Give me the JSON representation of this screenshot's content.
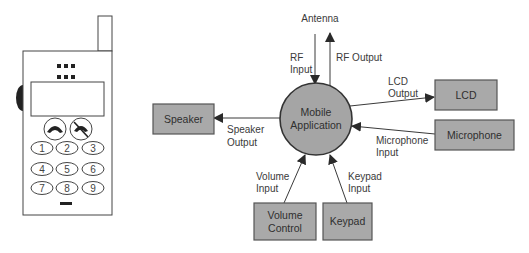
{
  "colors": {
    "box_fill": "#a9a9a9",
    "box_stroke": "#555555",
    "circle_fill": "#a5a5a5",
    "circle_stroke": "#333333",
    "line": "#3a3a3a",
    "text": "#3a3a3a"
  },
  "phone": {
    "keys": [
      "1",
      "2",
      "3",
      "4",
      "5",
      "6",
      "7",
      "8",
      "9"
    ],
    "call_button_icon": "phone-answer-icon",
    "end_button_icon": "phone-hangup-icon"
  },
  "center": {
    "line1": "Mobile",
    "line2": "Application"
  },
  "antenna_label": "Antenna",
  "boxes": {
    "speaker": "Speaker",
    "lcd": "LCD",
    "microphone": "Microphone",
    "volume_line1": "Volume",
    "volume_line2": "Control",
    "keypad": "Keypad"
  },
  "flows": {
    "rf_input_1": "RF",
    "rf_input_2": "Input",
    "rf_output": "RF Output",
    "lcd_output_1": "LCD",
    "lcd_output_2": "Output",
    "speaker_output_1": "Speaker",
    "speaker_output_2": "Output",
    "microphone_input_1": "Microphone",
    "microphone_input_2": "Input",
    "volume_input_1": "Volume",
    "volume_input_2": "Input",
    "keypad_input_1": "Keypad",
    "keypad_input_2": "Input"
  }
}
